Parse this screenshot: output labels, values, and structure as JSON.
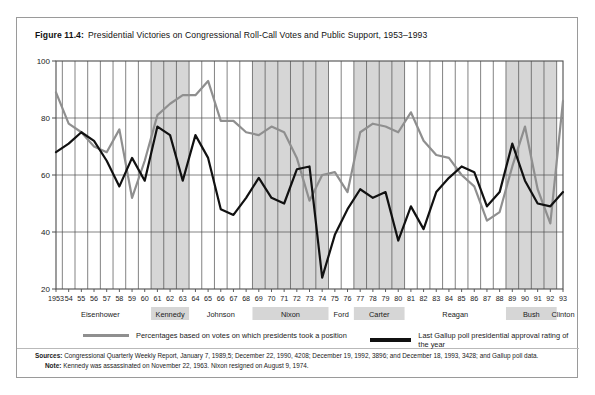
{
  "figure": {
    "label": "Figure 11.4:",
    "title": "Presidential Victories on Congressional Roll-Call Votes and Public Support, 1953–1993"
  },
  "legend": {
    "series_1": "Percentages based on votes on which presidents took a position",
    "series_2": "Last Gallup poll presidential approval rating of the year"
  },
  "notes": {
    "sources_label": "Sources:",
    "sources_text": "Congressional Quarterly Weekly Report, January 7, 1989,5; December 22, 1990, 4208; December 19, 1992, 3896; and December 18, 1993, 3428; and Gallup poll data.",
    "note_label": "Note:",
    "note_text": "Kennedy was assassinated on November 22, 1963.  Nixon resigned on August 9, 1974."
  },
  "colors": {
    "series_1": "#8f8f8f",
    "series_2": "#111111",
    "grid": "#4d4d4d",
    "band": "#d6d6d6",
    "axis": "#4d4d4d",
    "frame": "#9a9a9a"
  },
  "chart_data": {
    "type": "line",
    "title": "Presidential Victories on Congressional Roll-Call Votes and Public Support, 1953–1993",
    "xlabel": "",
    "ylabel": "",
    "ylim": [
      20,
      100
    ],
    "yticks": [
      20,
      40,
      60,
      80,
      100
    ],
    "grid": true,
    "legend_position": "below",
    "x": [
      1953,
      1954,
      1955,
      1956,
      1957,
      1958,
      1959,
      1960,
      1961,
      1962,
      1963,
      1964,
      1965,
      1966,
      1967,
      1968,
      1969,
      1970,
      1971,
      1972,
      1973,
      1974,
      1975,
      1976,
      1977,
      1978,
      1979,
      1980,
      1981,
      1982,
      1983,
      1984,
      1985,
      1986,
      1987,
      1988,
      1989,
      1990,
      1991,
      1992,
      1993
    ],
    "xtick_labels": [
      "1953",
      "54",
      "55",
      "56",
      "57",
      "58",
      "59",
      "60",
      "61",
      "62",
      "63",
      "64",
      "65",
      "66",
      "67",
      "68",
      "69",
      "70",
      "71",
      "72",
      "73",
      "74",
      "75",
      "76",
      "77",
      "78",
      "79",
      "80",
      "81",
      "82",
      "83",
      "84",
      "85",
      "86",
      "87",
      "88",
      "89",
      "90",
      "91",
      "92",
      "93"
    ],
    "series": [
      {
        "name": "Percentages based on votes on which presidents took a position",
        "color": "#8f8f8f",
        "width": 2.2,
        "values": [
          89,
          78,
          75,
          70,
          68,
          76,
          52,
          65,
          81,
          85,
          88,
          88,
          93,
          79,
          79,
          75,
          74,
          77,
          75,
          66,
          51,
          60,
          61,
          54,
          75,
          78,
          77,
          75,
          82,
          72,
          67,
          66,
          60,
          56,
          44,
          47,
          63,
          77,
          55,
          43,
          86
        ]
      },
      {
        "name": "Last Gallup poll presidential approval rating of the year",
        "color": "#111111",
        "width": 2.2,
        "values": [
          68,
          71,
          75,
          72,
          65,
          56,
          66,
          58,
          77,
          74,
          58,
          74,
          66,
          48,
          46,
          52,
          59,
          52,
          50,
          62,
          63,
          24,
          39,
          48,
          55,
          52,
          54,
          37,
          49,
          41,
          54,
          59,
          63,
          61,
          49,
          54,
          71,
          58,
          50,
          49,
          54
        ]
      }
    ],
    "bands": [
      {
        "label": "Eisenhower",
        "start": 1953,
        "end": 1960,
        "shaded": false
      },
      {
        "label": "Kennedy",
        "start": 1961,
        "end": 1963,
        "shaded": true
      },
      {
        "label": "Johnson",
        "start": 1964,
        "end": 1968,
        "shaded": false
      },
      {
        "label": "Nixon",
        "start": 1969,
        "end": 1974,
        "shaded": true
      },
      {
        "label": "Ford",
        "start": 1975,
        "end": 1976,
        "shaded": false
      },
      {
        "label": "Carter",
        "start": 1977,
        "end": 1980,
        "shaded": true
      },
      {
        "label": "Reagan",
        "start": 1981,
        "end": 1988,
        "shaded": false
      },
      {
        "label": "Bush",
        "start": 1989,
        "end": 1992,
        "shaded": true
      },
      {
        "label": "Clinton",
        "start": 1993,
        "end": 1993,
        "shaded": false
      }
    ]
  }
}
